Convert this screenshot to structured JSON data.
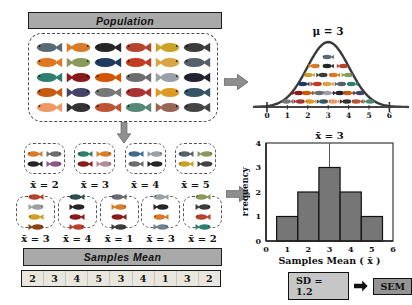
{
  "population": {
    "header": "Population",
    "fish_colors": [
      "#5a6b76",
      "#d97b29",
      "#262626",
      "#b5432e",
      "#c9a227",
      "#3c3c3c",
      "#e07820",
      "#8a9a5b",
      "#1f3a5f",
      "#c23b22",
      "#d9a443",
      "#55606b",
      "#2e7f6f",
      "#8b1a1a",
      "#d45500",
      "#6d6d6d",
      "#9aa0a6",
      "#222233",
      "#c75b12",
      "#444466",
      "#777777",
      "#aa3333",
      "#dd9922",
      "#335566",
      "#ee9966",
      "#333333",
      "#bb5533",
      "#558877",
      "#996655",
      "#444444"
    ]
  },
  "bell": {
    "mu_label": "μ = 3",
    "axis_ticks": [
      "0",
      "1",
      "2",
      "3",
      "4",
      "5",
      "6"
    ],
    "fish_rows": [
      1,
      3,
      4,
      5,
      7,
      8
    ]
  },
  "samples": {
    "row1": [
      {
        "label": "x̄ = 2",
        "fish": [
          "#d97b29",
          "#6d6d6d",
          "#262626",
          "#8a5a83"
        ]
      },
      {
        "label": "x̄ = 3",
        "fish": [
          "#2e7f6f",
          "#d97b29",
          "#8b1a1a",
          "#b08f9a"
        ]
      },
      {
        "label": "x̄ = 4",
        "fish": [
          "#3f6c8c",
          "#9aa0a6",
          "#6d6d6d",
          "#262626"
        ]
      },
      {
        "label": "x̄ = 5",
        "fish": [
          "#55606b",
          "#8a9a5b",
          "#c9a227",
          "#444444"
        ]
      }
    ],
    "row2": [
      {
        "label": "x̄ = 3",
        "fish": [
          "#b5432e",
          "#9aa0a6",
          "#c9a227",
          "#8b4513"
        ]
      },
      {
        "label": "x̄ = 4",
        "fish": [
          "#2f4f4f",
          "#262626",
          "#8b1a1a",
          "#b5432e"
        ]
      },
      {
        "label": "x̄ = 1",
        "fish": [
          "#6d6d6d",
          "#d97b29",
          "#8b1a1a",
          "#3c3c3c"
        ]
      },
      {
        "label": "x̄ = 3",
        "fish": [
          "#9aa0a6",
          "#262626",
          "#d97b29",
          "#708090"
        ]
      },
      {
        "label": "x̄ = 2",
        "fish": [
          "#8a9a5b",
          "#3c3c3c",
          "#b5432e",
          "#2e7f6f"
        ]
      }
    ],
    "header": "Samples Mean",
    "strip_values": [
      "2",
      "3",
      "4",
      "5",
      "3",
      "4",
      "1",
      "3",
      "2"
    ]
  },
  "sem": {
    "sd_label": "SD = 1.2",
    "sem_label": "SEM"
  },
  "chart_data": [
    {
      "type": "area",
      "subtype": "normal-distribution-curve",
      "title": "μ = 3",
      "mu": 3,
      "xlim": [
        0,
        6
      ],
      "x_ticks": [
        "0",
        "1",
        "2",
        "3",
        "4",
        "5",
        "6"
      ],
      "grid": false,
      "note": "bell curve over axis 0-6 filled with small fish icons; peak at x = 3"
    },
    {
      "type": "bar",
      "title": "x̄ = 3",
      "categories": [
        1,
        2,
        3,
        4,
        5
      ],
      "values": [
        1,
        2,
        3,
        2,
        1
      ],
      "xlabel": "Samples  Mean ( x̄ )",
      "ylabel": "Frequency",
      "xlim": [
        0,
        6
      ],
      "ylim": [
        0,
        4
      ],
      "x_ticks": [
        "0",
        "1",
        "2",
        "3",
        "4",
        "5",
        "6"
      ],
      "y_ticks": [
        "0",
        "1",
        "2",
        "3",
        "4"
      ],
      "bar_color": "#767676",
      "annotation_line_x": 3,
      "grid": false,
      "legend": null
    }
  ],
  "colors": {
    "header_bg": "#a9a9a9",
    "arrow_gray": "#8f8f8f",
    "arrow_black": "#111111",
    "strip_bg": "#e8e6dd",
    "bar_gray": "#767676",
    "sd_box_bg": "#c6c6c6",
    "sem_box_bg": "#949494",
    "curve_stroke": "#3a3a3a"
  }
}
